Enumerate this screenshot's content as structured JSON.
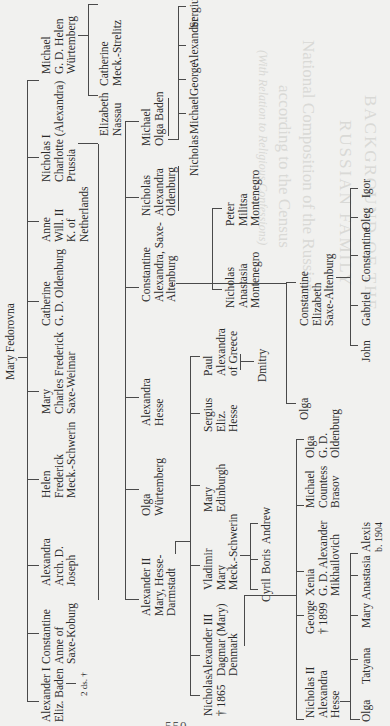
{
  "page": {
    "orientation": "rotated-90-ccw",
    "page_number_partial": "550",
    "paper_color": "#f1f1ef",
    "ink_color": "#2b2b2b"
  },
  "bleed_through": {
    "title_line1": "BACKGROUND OF THE",
    "title_line2": "RUSSIAN FAMILY",
    "subtitle": "National Composition of the Russian",
    "subtitle2": "according to the Census",
    "caption": "(With Relation to Religious Confessions)"
  },
  "tree": {
    "root": {
      "lines": [
        "Mary Fedorovna"
      ]
    },
    "gen1": [
      {
        "id": "alexander-i",
        "lines": [
          "Alexander I",
          "Eliz. Baden"
        ],
        "note": "2 ds. †"
      },
      {
        "id": "constantine",
        "lines": [
          "Constantine",
          "Anne of",
          "Saxe-Koburg"
        ]
      },
      {
        "id": "alexandra",
        "lines": [
          "Alexandra",
          "Arch. D.",
          "Joseph"
        ]
      },
      {
        "id": "helen",
        "lines": [
          "Helen",
          "Frederick",
          "Meck.-Schwerin"
        ]
      },
      {
        "id": "mary",
        "lines": [
          "Mary",
          "Charles Frederick",
          "Saxe-Weimar"
        ]
      },
      {
        "id": "catherine",
        "lines": [
          "Catherine",
          "G. D. Oldenburg"
        ]
      },
      {
        "id": "anne",
        "lines": [
          "Anne",
          "Will. II",
          "K. of",
          "Netherlands"
        ]
      },
      {
        "id": "nicholas-i",
        "lines": [
          "Nicholas I",
          "Charlotte (Alexandra)",
          "Prussia"
        ]
      },
      {
        "id": "michael",
        "lines": [
          "Michael",
          "G. D. Helen",
          "Würtemberg"
        ]
      }
    ],
    "gen2_michael": [
      {
        "id": "elizabeth",
        "lines": [
          "Elizabeth",
          "Nassau"
        ]
      },
      {
        "id": "catherine-ms",
        "lines": [
          "Catherine",
          "Meck.-Strelitz"
        ]
      }
    ],
    "gen2_nicholas": [
      {
        "id": "alexander-ii",
        "lines": [
          "Alexander II",
          "Mary, Hesse-",
          "Darmstadt"
        ]
      },
      {
        "id": "olga-w",
        "lines": [
          "Olga",
          "Würtemberg"
        ]
      },
      {
        "id": "alexandra-h",
        "lines": [
          "Alexandra",
          "Hesse"
        ]
      },
      {
        "id": "constantine-sa",
        "lines": [
          "Constantine",
          "Alexandra, Saxe-",
          "Altenburg"
        ]
      },
      {
        "id": "nicholas-o",
        "lines": [
          "Nicholas",
          "Alexandra",
          "Oldenburg"
        ]
      },
      {
        "id": "michael-b",
        "lines": [
          "Michael",
          "Olga Baden"
        ]
      }
    ],
    "gen3_michael_b": [
      {
        "id": "nicholas-mb",
        "lines": [
          "Nicholas"
        ]
      },
      {
        "id": "michael-mb",
        "lines": [
          "Michael"
        ]
      },
      {
        "id": "george-mb",
        "lines": [
          "George"
        ]
      },
      {
        "id": "alexander-mb",
        "lines": [
          "Alexander"
        ]
      },
      {
        "id": "sergius-mb",
        "lines": [
          "Sergius"
        ]
      }
    ],
    "gen3_nicholas_o": [
      {
        "id": "nicholas-m",
        "lines": [
          "Nicholas",
          "Anastasia",
          "Montenegro"
        ]
      },
      {
        "id": "peter-m",
        "lines": [
          "Peter",
          "Militsa",
          "Montenegro"
        ]
      }
    ],
    "gen3_constantine_sa": [
      {
        "id": "olga-c",
        "lines": [
          "Olga"
        ]
      },
      {
        "id": "constantine-e",
        "lines": [
          "Constantine",
          "Elizabeth",
          "Saxe-Altenburg"
        ]
      }
    ],
    "gen4_constantine_e": [
      {
        "id": "john",
        "lines": [
          "John"
        ]
      },
      {
        "id": "gabriel",
        "lines": [
          "Gabriel"
        ]
      },
      {
        "id": "constantine-k",
        "lines": [
          "Constantine"
        ]
      },
      {
        "id": "oleg",
        "lines": [
          "Oleg"
        ]
      },
      {
        "id": "igor",
        "lines": [
          "Igor"
        ]
      }
    ],
    "gen3_alexander_ii": [
      {
        "id": "nicholas-1865",
        "lines": [
          "Nicholas",
          "† 1865"
        ]
      },
      {
        "id": "alexander-iii",
        "lines": [
          "Alexander III",
          "Dagmar (Mary)",
          "Denmark"
        ]
      },
      {
        "id": "vladimir",
        "lines": [
          "Vladimir",
          "Mary",
          "Meck.-Schwerin"
        ]
      },
      {
        "id": "mary-e",
        "lines": [
          "Mary",
          "Edinburgh"
        ]
      },
      {
        "id": "sergius-h",
        "lines": [
          "Sergius",
          "Eliz.",
          "Hesse"
        ]
      },
      {
        "id": "paul",
        "lines": [
          "Paul",
          "Alexandra",
          "of Greece"
        ]
      }
    ],
    "gen4_vladimir": [
      {
        "id": "cyril",
        "lines": [
          "Cyril"
        ]
      },
      {
        "id": "boris",
        "lines": [
          "Boris"
        ]
      },
      {
        "id": "andrew",
        "lines": [
          "Andrew"
        ]
      }
    ],
    "gen4_paul": [
      {
        "id": "dmitry",
        "lines": [
          "Dmitry"
        ]
      }
    ],
    "gen4_alexander_iii": [
      {
        "id": "nicholas-ii",
        "lines": [
          "Nicholas II",
          "Alexandra",
          "Hesse"
        ]
      },
      {
        "id": "george-1899",
        "lines": [
          "George",
          "† 1899"
        ]
      },
      {
        "id": "xenia",
        "lines": [
          "Xenia",
          "G. D. Alexander",
          "Mikhailovich"
        ]
      },
      {
        "id": "michael-br",
        "lines": [
          "Michael",
          "Countess",
          "Brasov"
        ]
      },
      {
        "id": "olga-gd",
        "lines": [
          "Olga",
          "G. D.",
          "Oldenburg"
        ]
      }
    ],
    "gen5_nicholas_ii": [
      {
        "id": "olga-n",
        "lines": [
          "Olga"
        ]
      },
      {
        "id": "tatyana",
        "lines": [
          "Tatyana"
        ]
      },
      {
        "id": "mary-n",
        "lines": [
          "Mary"
        ]
      },
      {
        "id": "anastasia",
        "lines": [
          "Anastasia"
        ]
      },
      {
        "id": "alexis",
        "lines": [
          "Alexis",
          "b. 1904"
        ]
      }
    ]
  }
}
